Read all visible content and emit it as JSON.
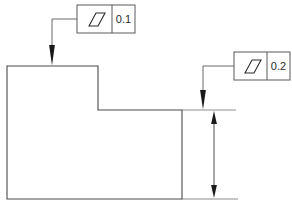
{
  "drawing": {
    "type": "gdt-parallelism-technical-drawing",
    "background_color": "#ffffff",
    "line_color": "#4a4a4a",
    "frame_line_color": "#5a5a5a",
    "text_color": "#2b2b2b",
    "arrow_color": "#1a1a1a"
  },
  "part": {
    "name": "stepped-block-profile",
    "outline_points": "7,66 98,66 98,110 182,110 182,199 7,199",
    "fill": "#ffffff"
  },
  "feature_control_frames": [
    {
      "id": "fcf-upper",
      "symbol_name": "parallelism-symbol",
      "symbol_label": "parallelism",
      "tolerance": "0.1",
      "frame": {
        "x": 77,
        "y": 5,
        "width": 58,
        "height": 28
      },
      "divider_x": 112,
      "symbol_box": {
        "x": 84,
        "y": 10,
        "width": 21,
        "height": 17
      },
      "leader": {
        "horizontal": {
          "x1": 52,
          "y1": 19,
          "x2": 77,
          "y2": 19
        },
        "vertical": {
          "x1": 52,
          "y1": 19,
          "x2": 52,
          "y2": 58
        },
        "arrow_tip": {
          "x": 52,
          "y": 66
        }
      }
    },
    {
      "id": "fcf-lower",
      "symbol_name": "parallelism-symbol",
      "symbol_label": "parallelism",
      "tolerance": "0.2",
      "frame": {
        "x": 234,
        "y": 52,
        "width": 56,
        "height": 28
      },
      "divider_x": 267,
      "symbol_box": {
        "x": 240,
        "y": 57,
        "width": 21,
        "height": 17
      },
      "leader": {
        "horizontal": {
          "x1": 203,
          "y1": 66,
          "x2": 234,
          "y2": 66
        },
        "vertical": {
          "x1": 203,
          "y1": 66,
          "x2": 203,
          "y2": 102
        },
        "arrow_tip": {
          "x": 203,
          "y": 110
        }
      }
    }
  ],
  "dimension": {
    "name": "vertical-step-height-dimension",
    "line_x": 214,
    "top_y": 110,
    "bottom_y": 199,
    "extension_lines": [
      {
        "x1": 182,
        "y1": 110,
        "x2": 236,
        "y2": 110
      },
      {
        "x1": 182,
        "y1": 199,
        "x2": 238,
        "y2": 199
      }
    ]
  }
}
